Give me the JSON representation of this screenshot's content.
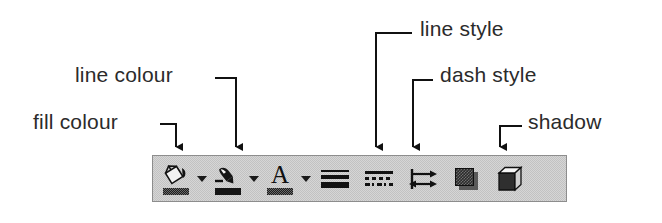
{
  "callouts": [
    {
      "id": "fill-colour",
      "label": "fill colour",
      "target_icon": "fill-colour-button"
    },
    {
      "id": "line-colour",
      "label": "line colour",
      "target_icon": "line-colour-button"
    },
    {
      "id": "line-style",
      "label": "line style",
      "target_icon": "line-style-button"
    },
    {
      "id": "dash-style",
      "label": "dash style",
      "target_icon": "dash-style-button"
    },
    {
      "id": "shadow",
      "label": "shadow",
      "target_icon": "shadow-button"
    }
  ],
  "toolbar": {
    "name": "Drawing object properties toolbar",
    "background_color": "#d6d6d6",
    "border_color": "#8d8d8d",
    "buttons": [
      {
        "id": "fill-colour-button",
        "icon": "paint-bucket-icon",
        "has_dropdown": true,
        "swatch_color": "#1d1d1d"
      },
      {
        "id": "line-colour-button",
        "icon": "pen-icon",
        "has_dropdown": true,
        "swatch_color": "#161616"
      },
      {
        "id": "font-colour-button",
        "icon": "letter-a-icon",
        "has_dropdown": true,
        "swatch_color": "#161616",
        "glyph": "A"
      },
      {
        "id": "line-style-button",
        "icon": "line-weight-icon",
        "has_dropdown": false
      },
      {
        "id": "dash-style-button",
        "icon": "dash-pattern-icon",
        "has_dropdown": false
      },
      {
        "id": "arrow-style-button",
        "icon": "arrow-style-icon",
        "has_dropdown": false
      },
      {
        "id": "shadow-button",
        "icon": "shadow-icon",
        "has_dropdown": false
      },
      {
        "id": "threed-button",
        "icon": "cube-3d-icon",
        "has_dropdown": false
      }
    ]
  }
}
